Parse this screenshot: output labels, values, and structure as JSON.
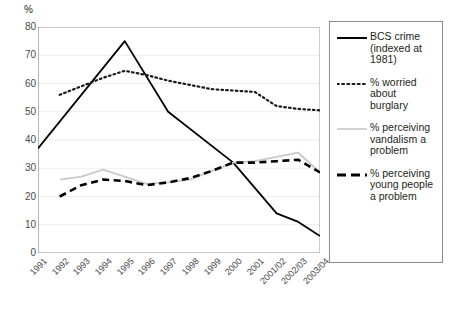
{
  "chart_data": {
    "type": "line",
    "title": "",
    "xlabel": "",
    "ylabel": "%",
    "ylim": [
      0,
      80
    ],
    "ytick_step": 10,
    "yticks": [
      "80",
      "70",
      "60",
      "50",
      "40",
      "30",
      "20",
      "10",
      "0"
    ],
    "grid": true,
    "legend_position": "right",
    "categories": [
      "1991",
      "1992",
      "1993",
      "1994",
      "1995",
      "1996",
      "1997",
      "1998",
      "1999",
      "2000",
      "2001",
      "2001/02",
      "2002/03",
      "2003/04"
    ],
    "series": [
      {
        "name": "BCS crime (indexed at 1981)",
        "style": "solid",
        "color": "#000000",
        "values": [
          37,
          null,
          null,
          null,
          75,
          null,
          50,
          null,
          null,
          32,
          null,
          14,
          11,
          6
        ]
      },
      {
        "name": "% worried about burglary",
        "style": "dotted",
        "color": "#1a1a1a",
        "values": [
          null,
          56,
          59,
          62,
          64.5,
          63,
          61,
          59.5,
          58,
          57.5,
          57,
          52,
          51,
          50.5
        ]
      },
      {
        "name": "% perceiving vandalism a problem",
        "style": "solid",
        "color": "#c9c9c9",
        "values": [
          null,
          26,
          27,
          29.5,
          27,
          24.5,
          25,
          26,
          29,
          32,
          32.5,
          34,
          35.5,
          28.5
        ]
      },
      {
        "name": "% perceiving young people a problem",
        "style": "dashed",
        "color": "#000000",
        "values": [
          null,
          20,
          24,
          26,
          25.5,
          24,
          25,
          26.5,
          29,
          32,
          32,
          32.5,
          33,
          28.5
        ]
      }
    ]
  },
  "legend": {
    "items": [
      {
        "label": "BCS crime (indexed at 1981)",
        "swatch": "solid-line-swatch"
      },
      {
        "label": "% worried about burglary",
        "swatch": "dotted-line-swatch"
      },
      {
        "label": "% perceiving vandalism a problem",
        "swatch": "grey-line-swatch"
      },
      {
        "label": "% perceiving young people a problem",
        "swatch": "dashed-line-swatch"
      }
    ]
  }
}
